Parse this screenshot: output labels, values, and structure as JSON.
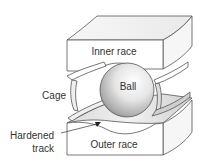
{
  "diagram": {
    "type": "ball-bearing-cutaway",
    "labels": {
      "inner_race": "Inner race",
      "ball": "Ball",
      "cage": "Cage",
      "hardened_track_line1": "Hardened",
      "hardened_track_line2": "track",
      "outer_race": "Outer race"
    },
    "colors": {
      "outline": "#555555",
      "face_fill": "#ffffff",
      "top_face_fill": "#f4f4f4",
      "track_fill": "#e2e2e2",
      "ball_light": "#ffffff",
      "ball_dark": "#8a8a8a",
      "text": "#333333"
    }
  }
}
